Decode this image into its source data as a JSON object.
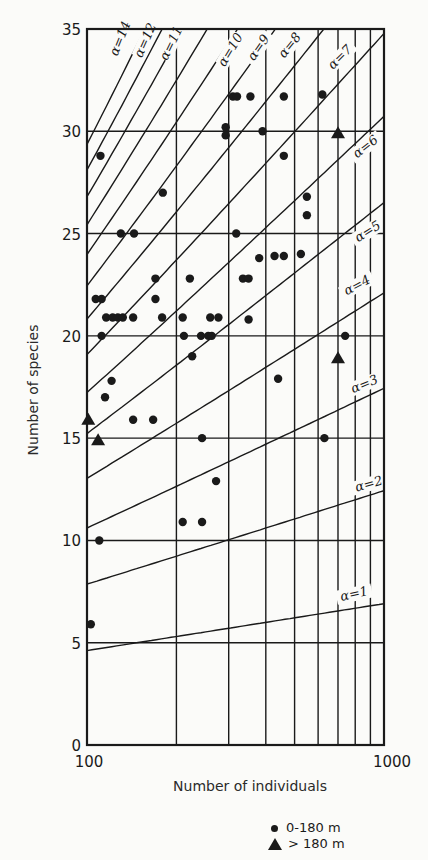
{
  "chart_data": {
    "type": "scatter",
    "title": "",
    "xlabel": "Number of individuals",
    "ylabel": "Number of species",
    "x_scale": "log",
    "xlim": [
      100,
      1000
    ],
    "ylim": [
      0,
      35
    ],
    "x_ticks": [
      100,
      1000
    ],
    "x_tick_labels": [
      "100",
      "1000"
    ],
    "y_ticks": [
      0,
      5,
      10,
      15,
      20,
      25,
      30,
      35
    ],
    "y_tick_labels": [
      "0",
      "5",
      "10",
      "15",
      "20",
      "25",
      "30",
      "35"
    ],
    "grid": true,
    "x_gridlines": [
      100,
      200,
      300,
      400,
      500,
      600,
      700,
      800,
      900,
      1000
    ],
    "y_gridlines": [
      5,
      10,
      15,
      20,
      25,
      30,
      35
    ],
    "legend_position": "bottom-right",
    "alpha_curves": [
      {
        "label": "α=1",
        "alpha": 1
      },
      {
        "label": "α=2",
        "alpha": 2
      },
      {
        "label": "α=3",
        "alpha": 3
      },
      {
        "label": "α=4",
        "alpha": 4
      },
      {
        "label": "α=5",
        "alpha": 5
      },
      {
        "label": "α=6",
        "alpha": 6
      },
      {
        "label": "α=7",
        "alpha": 7
      },
      {
        "label": "α=8",
        "alpha": 8
      },
      {
        "label": "α=9",
        "alpha": 9
      },
      {
        "label": "α=10",
        "alpha": 10
      },
      {
        "label": "α=11",
        "alpha": 11
      },
      {
        "label": "α=12",
        "alpha": 12
      },
      {
        "label": "α=13",
        "alpha": 13
      },
      {
        "label": "α=14",
        "alpha": 14
      }
    ],
    "series": [
      {
        "name": "0-180 m",
        "marker": "circle",
        "points": [
          [
            103,
            5.9
          ],
          [
            110,
            10
          ],
          [
            112,
            20
          ],
          [
            107,
            21.8
          ],
          [
            112,
            21.8
          ],
          [
            111,
            28.8
          ],
          [
            115,
            17
          ],
          [
            121,
            17.8
          ],
          [
            116,
            20.9
          ],
          [
            122,
            20.9
          ],
          [
            127,
            20.9
          ],
          [
            132,
            20.9
          ],
          [
            143,
            20.9
          ],
          [
            130,
            25
          ],
          [
            144,
            25
          ],
          [
            143,
            15.9
          ],
          [
            167,
            15.9
          ],
          [
            170,
            21.8
          ],
          [
            170,
            22.8
          ],
          [
            179,
            20.9
          ],
          [
            180,
            27
          ],
          [
            210,
            20.9
          ],
          [
            212,
            20
          ],
          [
            210,
            10.9
          ],
          [
            244,
            10.9
          ],
          [
            222,
            22.8
          ],
          [
            226,
            19
          ],
          [
            242,
            20
          ],
          [
            256,
            20
          ],
          [
            263,
            20
          ],
          [
            244,
            15
          ],
          [
            260,
            20.9
          ],
          [
            277,
            20.9
          ],
          [
            272,
            12.9
          ],
          [
            293,
            29.8
          ],
          [
            293,
            30.2
          ],
          [
            318,
            25
          ],
          [
            310,
            31.7
          ],
          [
            320,
            31.7
          ],
          [
            355,
            31.7
          ],
          [
            335,
            22.8
          ],
          [
            350,
            22.8
          ],
          [
            350,
            20.8
          ],
          [
            390,
            30
          ],
          [
            380,
            23.8
          ],
          [
            428,
            23.9
          ],
          [
            460,
            23.9
          ],
          [
            460,
            31.7
          ],
          [
            460,
            28.8
          ],
          [
            440,
            17.9
          ],
          [
            525,
            24
          ],
          [
            550,
            26.8
          ],
          [
            550,
            25.9
          ],
          [
            620,
            31.8
          ],
          [
            630,
            15
          ],
          [
            740,
            20
          ]
        ]
      },
      {
        "name": "> 180 m",
        "marker": "triangle",
        "points": [
          [
            101,
            15.9
          ],
          [
            109,
            14.9
          ],
          [
            700,
            18.9
          ],
          [
            700,
            29.9
          ]
        ]
      }
    ]
  },
  "legend": {
    "items": [
      {
        "label": "0-180 m",
        "marker": "circle"
      },
      {
        "label": "> 180 m",
        "marker": "triangle"
      }
    ]
  },
  "colors": {
    "ink": "#1a1a1a",
    "paper": "#fbfbf9"
  }
}
